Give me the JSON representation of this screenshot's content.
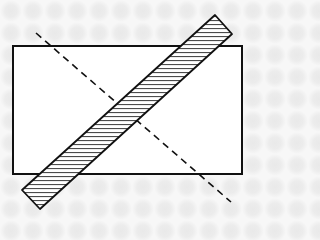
{
  "diagram": {
    "colors": {
      "stroke": "#111111",
      "rectangle_fill": "#ffffff",
      "bar_fill": "#ffffff",
      "hatch": "#222222",
      "background": "#f3f3f3"
    },
    "rectangle": {
      "x": 13,
      "y": 46,
      "width": 229,
      "height": 128
    },
    "dashed_line": {
      "x1": 36,
      "y1": 33,
      "x2": 231,
      "y2": 202,
      "dash": "7,5"
    },
    "hatched_bar": {
      "points": "215,15 232,34 40,209 22,190",
      "hatch_spacing": 4
    }
  }
}
